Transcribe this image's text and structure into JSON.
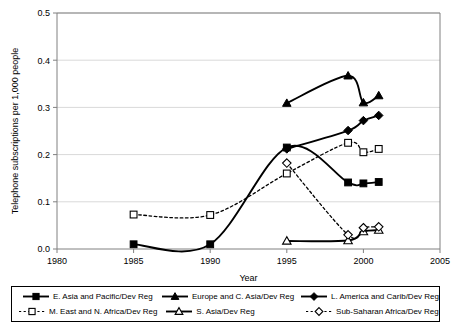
{
  "chart_data": {
    "type": "line",
    "title": "",
    "xlabel": "Year",
    "ylabel": "Telephone subscriptions per 1,000 people",
    "xlim": [
      1980,
      2005
    ],
    "ylim": [
      0.0,
      0.5
    ],
    "xticks": [
      "1980",
      "1985",
      "1990",
      "1995",
      "2000",
      "2005"
    ],
    "yticks": [
      "0.0",
      "0.1",
      "0.2",
      "0.3",
      "0.4",
      "0.5"
    ],
    "grid": "horizontal",
    "legend_position": "bottom",
    "series": [
      {
        "name": "E. Asia and Pacific/Dev Reg",
        "marker": "filled-square",
        "line": "solid",
        "x": [
          1985,
          1990,
          1995,
          1999,
          2000,
          2001
        ],
        "values": [
          0.01,
          0.01,
          0.215,
          0.141,
          0.139,
          0.142
        ]
      },
      {
        "name": "Europe and C. Asia/Dev Reg",
        "marker": "filled-triangle",
        "line": "solid",
        "x": [
          1995,
          1999,
          2000,
          2001
        ],
        "values": [
          0.309,
          0.367,
          0.31,
          0.325
        ]
      },
      {
        "name": "L. America and Carib/Dev Reg",
        "marker": "filled-diamond",
        "line": "solid",
        "x": [
          1995,
          1999,
          2000,
          2001
        ],
        "values": [
          0.212,
          0.251,
          0.272,
          0.283
        ]
      },
      {
        "name": "M. East and N. Africa/Dev Reg",
        "marker": "open-square",
        "line": "dotted",
        "x": [
          1985,
          1990,
          1995,
          1999,
          2000,
          2001
        ],
        "values": [
          0.073,
          0.072,
          0.16,
          0.225,
          0.205,
          0.212
        ]
      },
      {
        "name": "S. Asia/Dev Reg",
        "marker": "open-triangle",
        "line": "solid",
        "x": [
          1995,
          1999,
          2000,
          2001
        ],
        "values": [
          0.017,
          0.018,
          0.037,
          0.04
        ]
      },
      {
        "name": "Sub-Saharan Africa/Dev Reg",
        "marker": "open-diamond",
        "line": "dotted",
        "x": [
          1995,
          1999,
          2000,
          2001
        ],
        "values": [
          0.182,
          0.03,
          0.045,
          0.047
        ]
      }
    ]
  },
  "axes": {
    "y_title": "Telephone subscriptions per 1,000 people",
    "x_title": "Year",
    "y_tick_0": "0.0",
    "y_tick_1": "0.1",
    "y_tick_2": "0.2",
    "y_tick_3": "0.3",
    "y_tick_4": "0.4",
    "y_tick_5": "0.5",
    "x_tick_0": "1980",
    "x_tick_1": "1985",
    "x_tick_2": "1990",
    "x_tick_3": "1995",
    "x_tick_4": "2000",
    "x_tick_5": "2005"
  },
  "legend": {
    "items": [
      {
        "label": "E. Asia and Pacific/Dev Reg",
        "marker": "filled-square",
        "line": "solid"
      },
      {
        "label": "Europe and C. Asia/Dev Reg",
        "marker": "filled-triangle",
        "line": "solid"
      },
      {
        "label": "L. America and Carib/Dev Reg",
        "marker": "filled-diamond",
        "line": "solid"
      },
      {
        "label": "M. East and N. Africa/Dev Reg",
        "marker": "open-square",
        "line": "dotted"
      },
      {
        "label": "S. Asia/Dev Reg",
        "marker": "open-triangle",
        "line": "solid"
      },
      {
        "label": "Sub-Saharan Africa/Dev Reg",
        "marker": "open-diamond",
        "line": "dotted"
      }
    ]
  },
  "colors": {
    "line": "#000000",
    "grid": "#d9d9d9",
    "axis": "#808080",
    "background": "#ffffff"
  }
}
